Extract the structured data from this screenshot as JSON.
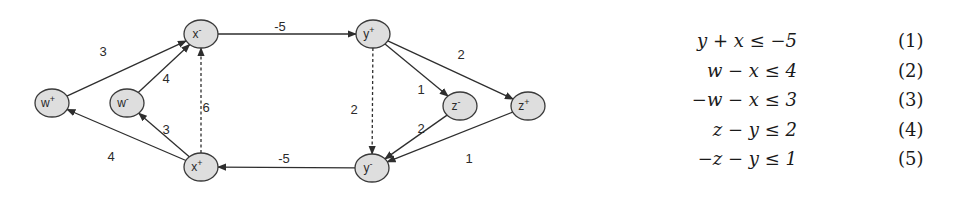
{
  "diagram": {
    "type": "constraint-graph",
    "nodes": [
      {
        "id": "w_plus",
        "base": "w",
        "sup": "+",
        "cx": 52,
        "cy": 103
      },
      {
        "id": "w_minus",
        "base": "w",
        "sup": "-",
        "cx": 127,
        "cy": 103
      },
      {
        "id": "x_minus",
        "base": "x",
        "sup": "-",
        "cx": 201,
        "cy": 34
      },
      {
        "id": "x_plus",
        "base": "x",
        "sup": "+",
        "cx": 201,
        "cy": 167
      },
      {
        "id": "y_plus",
        "base": "y",
        "sup": "+",
        "cx": 373,
        "cy": 34
      },
      {
        "id": "y_minus",
        "base": "y",
        "sup": "-",
        "cx": 372,
        "cy": 168
      },
      {
        "id": "z_minus",
        "base": "z",
        "sup": "-",
        "cx": 460,
        "cy": 106
      },
      {
        "id": "z_plus",
        "base": "z",
        "sup": "+",
        "cx": 528,
        "cy": 106
      }
    ],
    "edges": [
      {
        "from": "w_plus",
        "to": "x_minus",
        "weight": "3",
        "style": "solid",
        "label_x": 103,
        "label_y": 53
      },
      {
        "from": "w_minus",
        "to": "x_minus",
        "weight": "4",
        "style": "solid",
        "label_x": 166,
        "label_y": 80
      },
      {
        "from": "x_plus",
        "to": "x_minus",
        "weight": "6",
        "style": "dashed",
        "label_x": 206,
        "label_y": 109
      },
      {
        "from": "x_plus",
        "to": "w_minus",
        "weight": "3",
        "style": "solid",
        "label_x": 166,
        "label_y": 131
      },
      {
        "from": "x_plus",
        "to": "w_plus",
        "weight": "4",
        "style": "solid",
        "label_x": 111,
        "label_y": 158
      },
      {
        "from": "x_minus",
        "to": "y_plus",
        "weight": "-5",
        "style": "solid",
        "label_x": 280,
        "label_y": 28
      },
      {
        "from": "y_minus",
        "to": "x_plus",
        "weight": "-5",
        "style": "solid",
        "label_x": 284,
        "label_y": 160
      },
      {
        "from": "y_plus",
        "to": "y_minus",
        "weight": "2",
        "style": "dashed",
        "label_x": 354,
        "label_y": 111
      },
      {
        "from": "y_plus",
        "to": "z_minus",
        "weight": "1",
        "style": "solid",
        "label_x": 421,
        "label_y": 91
      },
      {
        "from": "y_plus",
        "to": "z_plus",
        "weight": "2",
        "style": "solid",
        "label_x": 461,
        "label_y": 56
      },
      {
        "from": "z_minus",
        "to": "y_minus",
        "weight": "2",
        "style": "solid",
        "label_x": 421,
        "label_y": 130
      },
      {
        "from": "z_plus",
        "to": "y_minus",
        "weight": "1",
        "style": "solid",
        "label_x": 469,
        "label_y": 160
      }
    ]
  },
  "equations": [
    {
      "expr": "y + x ≤ −5",
      "number": "(1)"
    },
    {
      "expr": "w − x ≤ 4",
      "number": "(2)"
    },
    {
      "expr": "−w − x ≤ 3",
      "number": "(3)"
    },
    {
      "expr": "z − y ≤ 2",
      "number": "(4)"
    },
    {
      "expr": "−z − y ≤ 1",
      "number": "(5)"
    }
  ]
}
